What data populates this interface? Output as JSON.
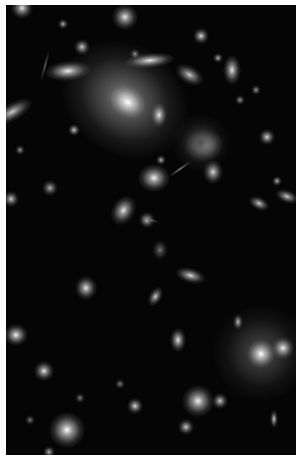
{
  "image": {
    "subject": "galaxy cluster deep field",
    "background": "#050505",
    "border": "#ffffff",
    "objects": [
      {
        "x": 22,
        "y": 8,
        "r": 7,
        "rx": 1,
        "ry": 1,
        "rot": 0,
        "b": 0.9
      },
      {
        "x": 125,
        "y": 17,
        "r": 8,
        "rx": 1,
        "ry": 1,
        "rot": 0,
        "b": 0.9
      },
      {
        "x": 63,
        "y": 24,
        "r": 3,
        "rx": 1,
        "ry": 1,
        "rot": 0,
        "b": 0.7
      },
      {
        "x": 82,
        "y": 47,
        "r": 5,
        "rx": 1,
        "ry": 1,
        "rot": 0,
        "b": 0.8
      },
      {
        "x": 68,
        "y": 71,
        "r": 8,
        "rx": 1.8,
        "ry": 0.8,
        "rot": -5,
        "b": 0.95
      },
      {
        "x": 150,
        "y": 61,
        "r": 8,
        "rx": 2,
        "ry": 0.6,
        "rot": -5,
        "b": 0.95
      },
      {
        "x": 125,
        "y": 100,
        "r": 38,
        "rx": 1.1,
        "ry": 0.9,
        "rot": 35,
        "b": 0.55
      },
      {
        "x": 128,
        "y": 102,
        "r": 10,
        "rx": 1.2,
        "ry": 0.9,
        "rot": 35,
        "b": 1
      },
      {
        "x": 159,
        "y": 115,
        "r": 6,
        "rx": 0.8,
        "ry": 1.2,
        "rot": 0,
        "b": 0.9
      },
      {
        "x": 201,
        "y": 36,
        "r": 5,
        "rx": 1,
        "ry": 1,
        "rot": 0,
        "b": 0.85
      },
      {
        "x": 190,
        "y": 75,
        "r": 7,
        "rx": 1.4,
        "ry": 0.8,
        "rot": 30,
        "b": 0.8
      },
      {
        "x": 232,
        "y": 70,
        "r": 7,
        "rx": 0.8,
        "ry": 1.3,
        "rot": 0,
        "b": 0.9
      },
      {
        "x": 218,
        "y": 58,
        "r": 3,
        "rx": 1,
        "ry": 1,
        "rot": 0,
        "b": 0.7
      },
      {
        "x": 256,
        "y": 90,
        "r": 3,
        "rx": 1,
        "ry": 1,
        "rot": 0,
        "b": 0.6
      },
      {
        "x": 12,
        "y": 112,
        "r": 8,
        "rx": 1.8,
        "ry": 0.7,
        "rot": -30,
        "b": 0.8
      },
      {
        "x": 74,
        "y": 130,
        "r": 4,
        "rx": 1,
        "ry": 1,
        "rot": 0,
        "b": 0.8
      },
      {
        "x": 267,
        "y": 137,
        "r": 5,
        "rx": 1,
        "ry": 1,
        "rot": 0,
        "b": 0.85
      },
      {
        "x": 204,
        "y": 145,
        "r": 10,
        "rx": 1.2,
        "ry": 1,
        "rot": 0,
        "b": 0.95
      },
      {
        "x": 201,
        "y": 143,
        "r": 18,
        "rx": 1,
        "ry": 1,
        "rot": 0,
        "b": 0.3
      },
      {
        "x": 154,
        "y": 178,
        "r": 9,
        "rx": 1.1,
        "ry": 1,
        "rot": 0,
        "b": 0.95
      },
      {
        "x": 213,
        "y": 172,
        "r": 6,
        "rx": 1,
        "ry": 1.2,
        "rot": 0,
        "b": 0.85
      },
      {
        "x": 161,
        "y": 160,
        "r": 3,
        "rx": 1,
        "ry": 1,
        "rot": 0,
        "b": 0.7
      },
      {
        "x": 50,
        "y": 188,
        "r": 5,
        "rx": 1,
        "ry": 1,
        "rot": 0,
        "b": 0.7
      },
      {
        "x": 11,
        "y": 199,
        "r": 5,
        "rx": 1,
        "ry": 1,
        "rot": 0,
        "b": 0.8
      },
      {
        "x": 124,
        "y": 210,
        "r": 8,
        "rx": 0.9,
        "ry": 1.2,
        "rot": 30,
        "b": 0.9
      },
      {
        "x": 147,
        "y": 220,
        "r": 5,
        "rx": 1,
        "ry": 1,
        "rot": 0,
        "b": 0.8
      },
      {
        "x": 259,
        "y": 203,
        "r": 5,
        "rx": 1.4,
        "ry": 0.8,
        "rot": 25,
        "b": 0.8
      },
      {
        "x": 287,
        "y": 196,
        "r": 5,
        "rx": 1.5,
        "ry": 0.8,
        "rot": 20,
        "b": 0.8
      },
      {
        "x": 277,
        "y": 181,
        "r": 3,
        "rx": 1,
        "ry": 1,
        "rot": 0,
        "b": 0.7
      },
      {
        "x": 160,
        "y": 250,
        "r": 5,
        "rx": 1,
        "ry": 1.3,
        "rot": 0,
        "b": 0.45
      },
      {
        "x": 190,
        "y": 276,
        "r": 6,
        "rx": 1.6,
        "ry": 0.8,
        "rot": 15,
        "b": 0.85
      },
      {
        "x": 86,
        "y": 288,
        "r": 7,
        "rx": 1,
        "ry": 1.1,
        "rot": 0,
        "b": 0.9
      },
      {
        "x": 155,
        "y": 296,
        "r": 5,
        "rx": 0.8,
        "ry": 1.3,
        "rot": 30,
        "b": 0.8
      },
      {
        "x": 16,
        "y": 335,
        "r": 7,
        "rx": 1.1,
        "ry": 1,
        "rot": 0,
        "b": 0.95
      },
      {
        "x": 178,
        "y": 340,
        "r": 6,
        "rx": 0.8,
        "ry": 1.3,
        "rot": 0,
        "b": 0.9
      },
      {
        "x": 238,
        "y": 322,
        "r": 4,
        "rx": 0.8,
        "ry": 1.3,
        "rot": 0,
        "b": 0.8
      },
      {
        "x": 261,
        "y": 353,
        "r": 30,
        "rx": 1,
        "ry": 1,
        "rot": 0,
        "b": 0.35
      },
      {
        "x": 261,
        "y": 354,
        "r": 9,
        "rx": 1,
        "ry": 1,
        "rot": 0,
        "b": 1
      },
      {
        "x": 283,
        "y": 348,
        "r": 7,
        "rx": 1,
        "ry": 1,
        "rot": 0,
        "b": 0.95
      },
      {
        "x": 44,
        "y": 371,
        "r": 6,
        "rx": 1,
        "ry": 1,
        "rot": 0,
        "b": 0.9
      },
      {
        "x": 135,
        "y": 406,
        "r": 5,
        "rx": 1,
        "ry": 1,
        "rot": 0,
        "b": 0.85
      },
      {
        "x": 198,
        "y": 401,
        "r": 10,
        "rx": 1,
        "ry": 1,
        "rot": 0,
        "b": 0.95
      },
      {
        "x": 220,
        "y": 401,
        "r": 5,
        "rx": 1,
        "ry": 1,
        "rot": 0,
        "b": 0.8
      },
      {
        "x": 274,
        "y": 419,
        "r": 4,
        "rx": 0.7,
        "ry": 1.4,
        "rot": 0,
        "b": 0.8
      },
      {
        "x": 186,
        "y": 427,
        "r": 5,
        "rx": 1,
        "ry": 1,
        "rot": 0,
        "b": 0.8
      },
      {
        "x": 67,
        "y": 430,
        "r": 11,
        "rx": 1,
        "ry": 1,
        "rot": 0,
        "b": 1
      },
      {
        "x": 49,
        "y": 452,
        "r": 4,
        "rx": 1,
        "ry": 1,
        "rot": 0,
        "b": 0.7
      },
      {
        "x": 135,
        "y": 54,
        "r": 3,
        "rx": 1,
        "ry": 1,
        "rot": 0,
        "b": 0.6
      },
      {
        "x": 240,
        "y": 100,
        "r": 3,
        "rx": 1,
        "ry": 1,
        "rot": 0,
        "b": 0.6
      },
      {
        "x": 20,
        "y": 150,
        "r": 3,
        "rx": 1,
        "ry": 1,
        "rot": 0,
        "b": 0.6
      },
      {
        "x": 120,
        "y": 384,
        "r": 3,
        "rx": 1,
        "ry": 1,
        "rot": 0,
        "b": 0.5
      },
      {
        "x": 80,
        "y": 398,
        "r": 3,
        "rx": 1,
        "ry": 1,
        "rot": 0,
        "b": 0.5
      },
      {
        "x": 30,
        "y": 420,
        "r": 3,
        "rx": 1,
        "ry": 1,
        "rot": 0,
        "b": 0.5
      }
    ],
    "arcs": [
      {
        "x": 45,
        "y": 65,
        "len": 30,
        "rot": 105,
        "b": 0.35
      },
      {
        "x": 180,
        "y": 168,
        "len": 26,
        "rot": -35,
        "b": 0.45
      },
      {
        "x": 150,
        "y": 219,
        "len": 18,
        "rot": 15,
        "b": 0.4
      }
    ]
  }
}
